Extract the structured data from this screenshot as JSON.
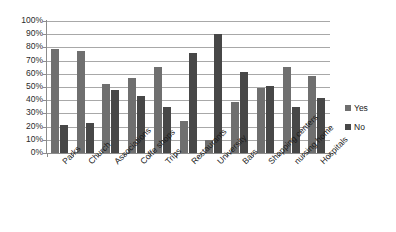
{
  "chart_data": {
    "type": "bar",
    "title": "",
    "subtitle": "",
    "xlabel": "",
    "ylabel": "",
    "ylim": [
      0,
      100
    ],
    "ytick_labels": [
      "100%",
      "90%",
      "80%",
      "70%",
      "60%",
      "50%",
      "40%",
      "30%",
      "20%",
      "10%",
      "0%"
    ],
    "ytick_values": [
      100,
      90,
      80,
      70,
      60,
      50,
      40,
      30,
      20,
      10,
      0
    ],
    "grid": "horizontal",
    "legend_position": "right",
    "categories": [
      "Parks",
      "Church",
      "Associations",
      "Coffe shops",
      "Trips",
      "Restaurants",
      "University",
      "Bars",
      "Shopping centers",
      "nursing home",
      "Hospitals"
    ],
    "series": [
      {
        "name": "Yes",
        "color": "#6f6f6f",
        "values": [
          79,
          77,
          52,
          57,
          65,
          24,
          10,
          39,
          49,
          65,
          58
        ]
      },
      {
        "name": "No",
        "color": "#474747",
        "values": [
          21,
          23,
          48,
          43,
          35,
          76,
          90,
          61,
          51,
          35,
          42
        ]
      }
    ]
  },
  "legend": {
    "items": [
      {
        "label": "Yes",
        "color": "#6f6f6f"
      },
      {
        "label": "No",
        "color": "#474747"
      }
    ]
  },
  "axes": {
    "y_max_label": "100%",
    "y_min_label": "0%"
  }
}
